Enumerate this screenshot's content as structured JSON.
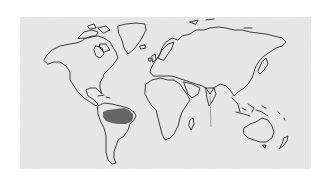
{
  "map": {
    "type": "world-outline-map",
    "projection": "equirectangular-style",
    "background_color": "#e4e4e4",
    "outline_color": "#2a2a2a",
    "highlighted_regions": [
      {
        "name": "Amazon Basin",
        "continent": "South America",
        "color": "#666666"
      }
    ],
    "continents": [
      "North America",
      "Greenland",
      "South America",
      "Europe",
      "Asia",
      "Africa",
      "Australia",
      "New Zealand"
    ],
    "features": [
      "Madagascar",
      "Japan",
      "Indonesia archipelago",
      "Caribbean islands",
      "British Isles"
    ]
  }
}
